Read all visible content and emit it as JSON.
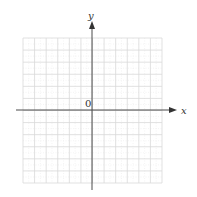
{
  "diagram": {
    "type": "coordinate_plane",
    "x_axis_label": "x",
    "y_axis_label": "y",
    "origin_label": "0",
    "grid": {
      "columns": 12,
      "rows": 12,
      "line_color": "#d9d9d9",
      "minor_color": "#ececec"
    },
    "axis_color": "#4a4a4a"
  }
}
